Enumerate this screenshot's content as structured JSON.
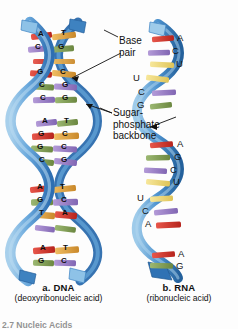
{
  "figure": {
    "title_number": "2.7  Nucleic Acids",
    "panels": [
      {
        "tag": "a.",
        "name": "DNA",
        "label_bold": "a.  DNA",
        "label_sub": "(deoxyribonucleic acid)"
      },
      {
        "tag": "b.",
        "name": "RNA",
        "label_bold": "b.  RNA",
        "label_sub": "(ribonucleic acid)"
      }
    ]
  },
  "annotations": {
    "base_pair": "Base\npair",
    "base_pair_line1": "Base",
    "base_pair_line2": "pair",
    "backbone_line1": "Sugar-",
    "backbone_line2": "phosphate",
    "backbone_line3": "backbone"
  },
  "colors": {
    "backbone_blue_light": "#7FB6E0",
    "backbone_blue_mid": "#3D84C6",
    "backbone_blue_dark": "#1F5FA0",
    "base_adenine": "#D4342B",
    "base_thymine": "#E0A23C",
    "base_guanine": "#7E9B4E",
    "base_cytosine": "#9B7FC4",
    "base_uracil": "#EFD87A",
    "background": "#FDFDFD",
    "text": "#111111"
  },
  "dna": {
    "label": "DNA double helix",
    "base_pairs": [
      {
        "left": "A",
        "right": "T"
      },
      {
        "left": "C",
        "right": "G"
      },
      {
        "left": "A",
        "right": "T"
      },
      {
        "left": "G",
        "right": "C"
      },
      {
        "left": "C",
        "right": "G"
      },
      {
        "left": "C",
        "right": "G"
      },
      {
        "left": "A",
        "right": "T"
      },
      {
        "left": "G",
        "right": "C"
      },
      {
        "left": "G",
        "right": "C"
      },
      {
        "left": "C",
        "right": "G"
      },
      {
        "left": "A",
        "right": "T"
      },
      {
        "left": "G",
        "right": "C"
      },
      {
        "left": "T",
        "right": "A"
      },
      {
        "left": "C",
        "right": "G"
      },
      {
        "left": "A",
        "right": "T"
      },
      {
        "left": "G",
        "right": "C"
      }
    ]
  },
  "rna": {
    "label": "RNA single strand",
    "bases": [
      "A",
      "C",
      "U",
      "U",
      "C",
      "G",
      "A",
      "G",
      "C",
      "U",
      "U",
      "C",
      "A",
      "A",
      "G"
    ]
  }
}
